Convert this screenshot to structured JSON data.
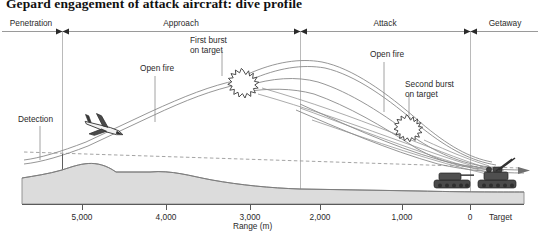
{
  "title": "Gepard engagement of attack aircraft: dive profile",
  "phases": [
    {
      "id": "penetration",
      "label": "Penetration",
      "center": 31
    },
    {
      "id": "approach",
      "label": "Approach",
      "center": 181
    },
    {
      "id": "attack",
      "label": "Attack",
      "center": 385
    },
    {
      "id": "getaway",
      "label": "Getaway",
      "center": 505
    }
  ],
  "phase_dividers": [
    62,
    300,
    470
  ],
  "annotations": [
    {
      "id": "detection",
      "lines": [
        "Detection"
      ],
      "x": 18,
      "y": 115
    },
    {
      "id": "open-fire-1",
      "lines": [
        "Open fire"
      ],
      "x": 140,
      "y": 64
    },
    {
      "id": "first-burst",
      "lines": [
        "First burst",
        "on target"
      ],
      "x": 190,
      "y": 36
    },
    {
      "id": "open-fire-2",
      "lines": [
        "Open fire"
      ],
      "x": 370,
      "y": 50
    },
    {
      "id": "second-burst",
      "lines": [
        "Second burst",
        "on target"
      ],
      "x": 405,
      "y": 80
    }
  ],
  "axis": {
    "title": "Range (m)",
    "ticks": [
      {
        "label": "5,000",
        "x": 82
      },
      {
        "label": "4,000",
        "x": 166
      },
      {
        "label": "3,000",
        "x": 250
      },
      {
        "label": "2,000",
        "x": 320
      },
      {
        "label": "1,000",
        "x": 402
      },
      {
        "label": "0",
        "x": 470
      }
    ],
    "target_label": "Target"
  },
  "vehicles": [
    {
      "id": "tank",
      "label": "tank-silhouette"
    },
    {
      "id": "gepard",
      "label": "gepard-spaag-silhouette"
    }
  ],
  "icons": {
    "aircraft": "attack-aircraft-icon",
    "burst": "burst-star-icon",
    "terrain": "terrain-profile"
  },
  "colors": {
    "ink": "#1a1a1a",
    "line": "#6b6b6b",
    "terrain_fill": "#dcdcdc",
    "terrain_stroke": "#8a8a8a",
    "vehicle_fill": "#4a4a4a",
    "rule": "#8c8c8c"
  }
}
